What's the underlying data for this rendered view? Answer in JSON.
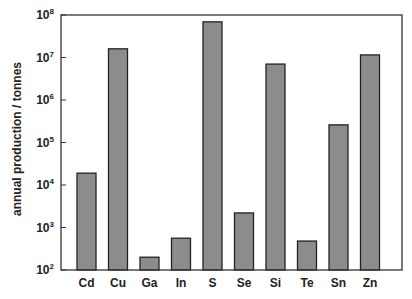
{
  "chart_data": {
    "type": "bar",
    "title": "",
    "xlabel": "",
    "ylabel": "annual production / tonnes",
    "yscale": "log",
    "ylim": [
      100,
      100000000
    ],
    "yticks": [
      "10^2",
      "10^3",
      "10^4",
      "10^5",
      "10^6",
      "10^7",
      "10^8"
    ],
    "grid": false,
    "legend": null,
    "categories": [
      "Cd",
      "Cu",
      "Ga",
      "In",
      "S",
      "Se",
      "Si",
      "Te",
      "Sn",
      "Zn"
    ],
    "values": [
      19000,
      16000000,
      200,
      560,
      69000000,
      2200,
      7000000,
      480,
      260000,
      11500000
    ],
    "bar_color": "#8c8c8c"
  },
  "axis": {
    "ylabel": "annual production / tonnes",
    "ytick_base": "10",
    "ytick_exps": [
      "2",
      "3",
      "4",
      "5",
      "6",
      "7",
      "8"
    ]
  }
}
